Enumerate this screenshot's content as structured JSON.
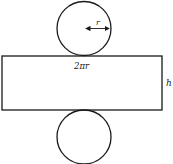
{
  "diagram": {
    "labels": {
      "radius": "r",
      "circumference": "2πr",
      "height": "h"
    },
    "colors": {
      "stroke": "#1a1a1a",
      "background": "#ffffff"
    }
  }
}
